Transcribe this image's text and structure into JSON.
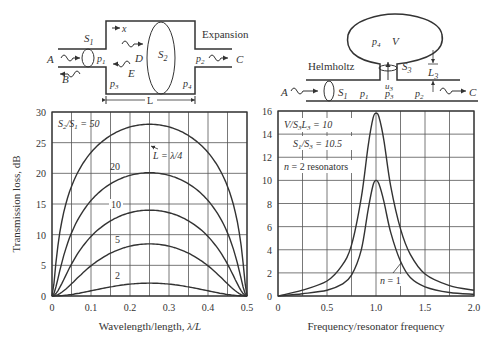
{
  "diagrams": {
    "expansion": {
      "title": "Expansion",
      "labels": {
        "A": "A",
        "B": "B",
        "C": "C",
        "D": "D",
        "E": "E",
        "S1": "S",
        "S1_sub": "1",
        "S2": "S",
        "S2_sub": "2",
        "p1": "p",
        "p1_sub": "1",
        "p2": "p",
        "p2_sub": "2",
        "p3": "p",
        "p3_sub": "3",
        "p4": "p",
        "p4_sub": "4",
        "x": "x",
        "L": "L"
      }
    },
    "helmholtz": {
      "title": "Helmholtz",
      "labels": {
        "A": "A",
        "C": "C",
        "S1": "S",
        "S1_sub": "1",
        "S3": "S",
        "S3_sub": "3",
        "p1": "p",
        "p1_sub": "1",
        "p2": "p",
        "p2_sub": "2",
        "p3": "p",
        "p3_sub": "3",
        "p4": "p",
        "p4_sub": "4",
        "V": "V",
        "u3": "u",
        "u3_sub": "3",
        "L3": "L",
        "L3_sub": "3"
      }
    }
  },
  "chart_data": [
    {
      "type": "line",
      "title": "",
      "xlabel": "Wavelength/length, λ/L",
      "ylabel": "Transmission loss, dB",
      "xlim": [
        0,
        0.5
      ],
      "ylim": [
        0,
        30
      ],
      "xticks": [
        "0",
        "0.1",
        "0.2",
        "0.3",
        "0.4",
        "0.5"
      ],
      "yticks": [
        "0",
        "5",
        "10",
        "15",
        "20",
        "25",
        "30"
      ],
      "grid": true,
      "annotations": [
        "S2/S1 = 50",
        "L = λ/4"
      ],
      "series": [
        {
          "name": "S2/S1 = 50",
          "label": "S₂/S₁ = 50",
          "peak": 28.0,
          "peak_x": 0.25
        },
        {
          "name": "20",
          "label": "20",
          "peak": 20.1,
          "peak_x": 0.25
        },
        {
          "name": "10",
          "label": "10",
          "peak": 14.0,
          "peak_x": 0.25
        },
        {
          "name": "5",
          "label": "5",
          "peak": 8.5,
          "peak_x": 0.25
        },
        {
          "name": "2",
          "label": "2",
          "peak": 2.1,
          "peak_x": 0.25
        }
      ]
    },
    {
      "type": "line",
      "title": "",
      "xlabel": "Frequency/resonator frequency",
      "ylabel": "",
      "xlim": [
        0,
        2.0
      ],
      "ylim": [
        0,
        16
      ],
      "xticks": [
        "0",
        "0.5",
        "1.0",
        "1.5",
        "2.0"
      ],
      "yticks": [
        "0",
        "2",
        "4",
        "6",
        "8",
        "10",
        "12",
        "14",
        "16"
      ],
      "grid": true,
      "annotations": [
        "V/S3L3 = 10",
        "S1/S3 = 10.5",
        "n = 2 resonators",
        "n = 1"
      ],
      "series": [
        {
          "name": "n = 2",
          "x": [
            0,
            0.25,
            0.5,
            0.65,
            0.75,
            0.85,
            0.92,
            0.97,
            1.0,
            1.03,
            1.08,
            1.15,
            1.25,
            1.35,
            1.5,
            1.75,
            2.0
          ],
          "values": [
            0,
            0.5,
            1.3,
            2.6,
            4.4,
            8.5,
            13.0,
            15.4,
            15.8,
            15.5,
            13.5,
            9.5,
            5.8,
            3.6,
            1.9,
            0.9,
            0.5
          ]
        },
        {
          "name": "n = 1",
          "x": [
            0,
            0.25,
            0.5,
            0.65,
            0.75,
            0.85,
            0.92,
            0.97,
            1.0,
            1.03,
            1.08,
            1.15,
            1.25,
            1.35,
            1.5,
            1.75,
            2.0
          ],
          "values": [
            0,
            0.2,
            0.5,
            1.0,
            1.8,
            4.0,
            7.5,
            9.6,
            10.0,
            9.7,
            8.2,
            5.5,
            3.0,
            1.6,
            0.8,
            0.3,
            0.15
          ]
        }
      ]
    }
  ]
}
